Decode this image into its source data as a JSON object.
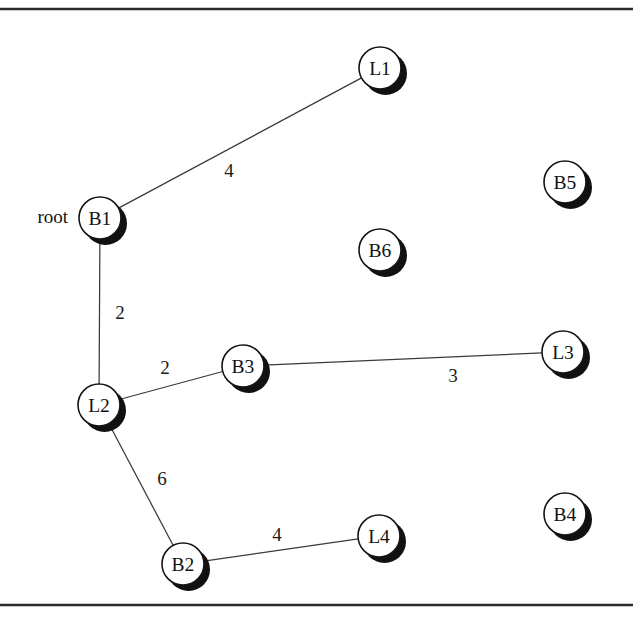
{
  "figure": {
    "width": 633,
    "height": 626,
    "background_color": "#ffffff",
    "line_color": "#3a3a3a",
    "node_fill_color": "#ffffff",
    "node_stroke_color": "#151515",
    "shadow_color": "#111111",
    "rules": [
      {
        "name": "top-rule",
        "y": 9
      },
      {
        "name": "bottom-rule",
        "y": 605
      }
    ]
  },
  "chart_data": {
    "type": "diagram",
    "diagram_kind": "weighted-graph",
    "title": "",
    "root_annotation": "root",
    "root_node": "B1",
    "nodes": [
      {
        "id": "B1",
        "label": "B1",
        "x": 100,
        "y": 218,
        "r": 21,
        "connected": true
      },
      {
        "id": "L1",
        "label": "L1",
        "x": 380,
        "y": 68,
        "r": 21,
        "connected": true
      },
      {
        "id": "L2",
        "label": "L2",
        "x": 99,
        "y": 405,
        "r": 21,
        "connected": true
      },
      {
        "id": "B3",
        "label": "B3",
        "x": 243,
        "y": 366,
        "r": 21,
        "connected": true
      },
      {
        "id": "L3",
        "label": "L3",
        "x": 563,
        "y": 352,
        "r": 21,
        "connected": true
      },
      {
        "id": "B2",
        "label": "B2",
        "x": 183,
        "y": 564,
        "r": 21,
        "connected": true
      },
      {
        "id": "L4",
        "label": "L4",
        "x": 379,
        "y": 536,
        "r": 21,
        "connected": true
      },
      {
        "id": "B5",
        "label": "B5",
        "x": 565,
        "y": 182,
        "r": 21,
        "connected": false
      },
      {
        "id": "B6",
        "label": "B6",
        "x": 380,
        "y": 250,
        "r": 21,
        "connected": false
      },
      {
        "id": "B4",
        "label": "B4",
        "x": 565,
        "y": 514,
        "r": 21,
        "connected": false
      }
    ],
    "edges": [
      {
        "from": "B1",
        "to": "L1",
        "weight": 4,
        "label_x": 229,
        "label_y": 170
      },
      {
        "from": "B1",
        "to": "L2",
        "weight": 2,
        "label_x": 120,
        "label_y": 312
      },
      {
        "from": "L2",
        "to": "B3",
        "weight": 2,
        "label_x": 165,
        "label_y": 367
      },
      {
        "from": "B3",
        "to": "L3",
        "weight": 3,
        "label_x": 453,
        "label_y": 375
      },
      {
        "from": "L2",
        "to": "B2",
        "weight": 6,
        "label_x": 162,
        "label_y": 478
      },
      {
        "from": "B2",
        "to": "L4",
        "weight": 4,
        "label_x": 277,
        "label_y": 534
      }
    ],
    "root_label_x": 68,
    "root_label_y": 216
  }
}
